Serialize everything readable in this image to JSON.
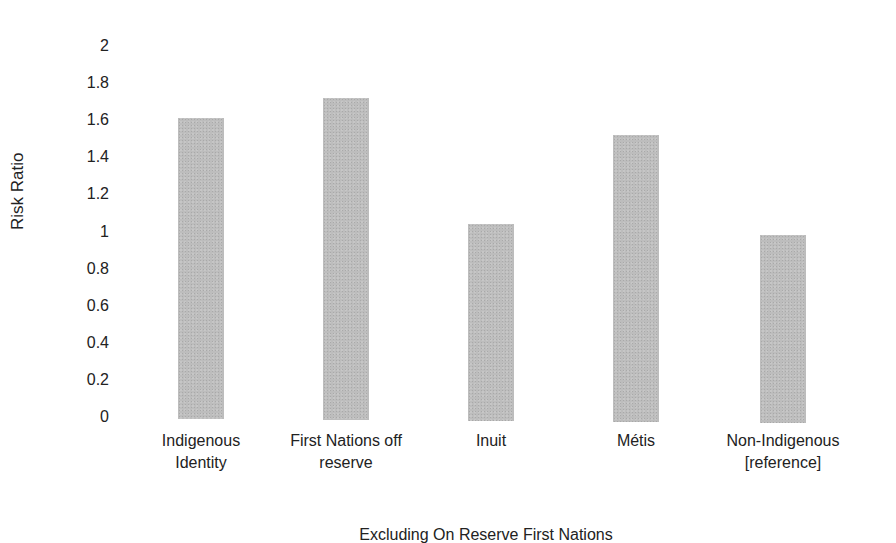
{
  "chart_data": {
    "type": "bar",
    "title": "",
    "xlabel": "Excluding On Reserve First Nations",
    "ylabel": "Risk Ratio",
    "ylim": [
      0,
      2
    ],
    "yticks": [
      "0",
      "0.2",
      "0.4",
      "0.6",
      "0.8",
      "1",
      "1.2",
      "1.4",
      "1.6",
      "1.8",
      "2"
    ],
    "grid": false,
    "legend": null,
    "categories": [
      "Indigenous Identity",
      "First Nations off reserve",
      "Inuit",
      "Métis",
      "Non-Indigenous [reference]"
    ],
    "category_lines": [
      [
        "Indigenous",
        "Identity"
      ],
      [
        "First Nations off",
        "reserve"
      ],
      [
        "Inuit",
        ""
      ],
      [
        "Métis",
        ""
      ],
      [
        "Non-Indigenous",
        "[reference]"
      ]
    ],
    "values": [
      1.61,
      1.72,
      1.04,
      1.52,
      0.98
    ],
    "bar_color": "#bdbdbd"
  }
}
